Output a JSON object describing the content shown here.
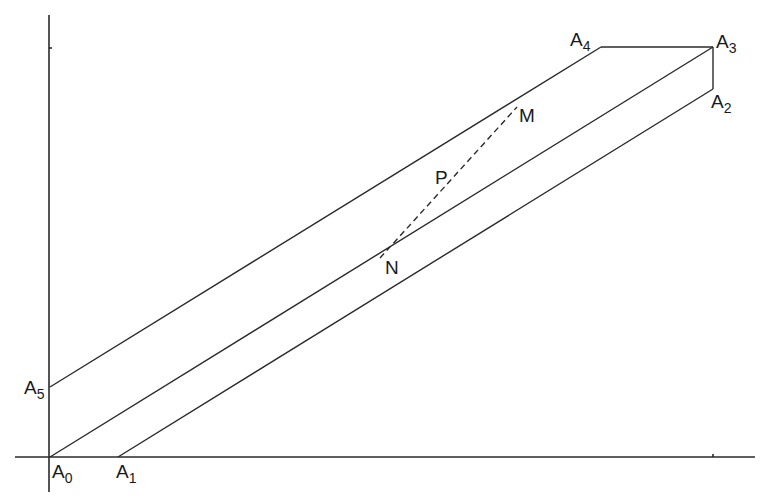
{
  "figure": {
    "type": "geometric-diagram",
    "colors": {
      "background": "#ffffff",
      "stroke": "#2a2a2a",
      "text": "#1a1a1a"
    },
    "axes": {
      "x_axis": {
        "from": [
          15,
          457
        ],
        "to": [
          755,
          457
        ],
        "tick_at": [
          713,
          457
        ]
      },
      "y_axis": {
        "from": [
          49,
          15
        ],
        "to": [
          49,
          492
        ],
        "tick_at": [
          49,
          48
        ]
      }
    },
    "vertices": [
      {
        "id": "A0",
        "letter": "A",
        "sub": "0",
        "point": [
          50,
          457
        ],
        "label_pos": [
          52,
          478
        ]
      },
      {
        "id": "A1",
        "letter": "A",
        "sub": "1",
        "point": [
          118,
          457
        ],
        "label_pos": [
          116,
          478
        ]
      },
      {
        "id": "A2",
        "letter": "A",
        "sub": "2",
        "point": [
          713,
          89
        ],
        "label_pos": [
          711,
          108
        ]
      },
      {
        "id": "A3",
        "letter": "A",
        "sub": "3",
        "point": [
          713,
          47
        ],
        "label_pos": [
          716,
          48
        ]
      },
      {
        "id": "A4",
        "letter": "A",
        "sub": "4",
        "point": [
          601,
          47
        ],
        "label_pos": [
          570,
          46
        ]
      },
      {
        "id": "A5",
        "letter": "A",
        "sub": "5",
        "point": [
          50,
          387
        ],
        "label_pos": [
          24,
          394
        ]
      }
    ],
    "segments": [
      {
        "name": "A0-A3",
        "from": [
          50,
          457
        ],
        "to": [
          713,
          47
        ],
        "style": "solid"
      },
      {
        "name": "A1-A2",
        "from": [
          118,
          457
        ],
        "to": [
          713,
          89
        ],
        "style": "solid"
      },
      {
        "name": "A5-A4",
        "from": [
          50,
          387
        ],
        "to": [
          601,
          47
        ],
        "style": "solid"
      },
      {
        "name": "A4-A3",
        "from": [
          601,
          47
        ],
        "to": [
          713,
          47
        ],
        "style": "solid"
      },
      {
        "name": "A3-A2",
        "from": [
          713,
          47
        ],
        "to": [
          713,
          89
        ],
        "style": "solid"
      },
      {
        "name": "N-M",
        "from": [
          380,
          258
        ],
        "to": [
          517,
          107
        ],
        "style": "dashed"
      }
    ],
    "points": [
      {
        "id": "M",
        "label": "M",
        "point": [
          517,
          107
        ],
        "label_pos": [
          519,
          122
        ]
      },
      {
        "id": "P",
        "label": "P",
        "point": [
          447,
          184
        ],
        "label_pos": [
          435,
          184
        ]
      },
      {
        "id": "N",
        "label": "N",
        "point": [
          390,
          247
        ],
        "label_pos": [
          385,
          274
        ]
      }
    ]
  }
}
